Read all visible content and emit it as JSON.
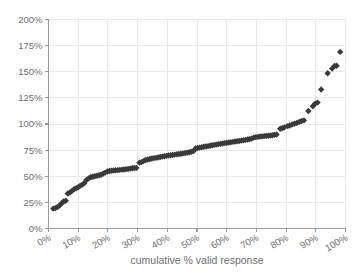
{
  "chart_data": {
    "type": "scatter",
    "title": "",
    "subtitle": "",
    "xlabel": "cumulative % valid response",
    "ylabel": "",
    "xlim": [
      0,
      100
    ],
    "ylim": [
      0,
      200
    ],
    "xticks": [
      "0%",
      "10%",
      "20%",
      "30%",
      "40%",
      "50%",
      "60%",
      "70%",
      "80%",
      "90%",
      "100%"
    ],
    "xtick_values": [
      0,
      10,
      20,
      30,
      40,
      50,
      60,
      70,
      80,
      90,
      100
    ],
    "yticks": [
      "0%",
      "25%",
      "50%",
      "75%",
      "100%",
      "125%",
      "150%",
      "175%",
      "200%"
    ],
    "ytick_values": [
      0,
      25,
      50,
      75,
      100,
      125,
      150,
      175,
      200
    ],
    "grid": true,
    "grid_color": "#e8e8e8",
    "axis_color": "#9a9a9a",
    "legend": false,
    "legend_position": "none",
    "marker": "diamond",
    "marker_color": "#3a3a3a",
    "marker_size": 3.2,
    "annotations": [],
    "series": [
      {
        "name": "cumulative valid response",
        "points": [
          [
            1.6,
            19.0
          ],
          [
            2.3,
            19.5
          ],
          [
            3.0,
            20.5
          ],
          [
            3.7,
            22.0
          ],
          [
            4.4,
            24.0
          ],
          [
            5.1,
            26.0
          ],
          [
            5.8,
            26.5
          ],
          [
            6.5,
            33.5
          ],
          [
            7.2,
            34.5
          ],
          [
            7.9,
            36.0
          ],
          [
            8.6,
            37.5
          ],
          [
            9.3,
            38.5
          ],
          [
            10.0,
            39.5
          ],
          [
            10.7,
            41.0
          ],
          [
            11.4,
            42.0
          ],
          [
            12.1,
            43.5
          ],
          [
            12.8,
            46.5
          ],
          [
            13.5,
            48.0
          ],
          [
            14.2,
            49.0
          ],
          [
            14.9,
            49.5
          ],
          [
            15.6,
            50.0
          ],
          [
            16.3,
            50.5
          ],
          [
            17.0,
            51.0
          ],
          [
            17.7,
            51.5
          ],
          [
            18.4,
            52.5
          ],
          [
            19.1,
            53.5
          ],
          [
            19.8,
            54.5
          ],
          [
            20.5,
            55.0
          ],
          [
            21.2,
            55.3
          ],
          [
            21.9,
            55.5
          ],
          [
            22.6,
            55.7
          ],
          [
            23.3,
            55.9
          ],
          [
            24.0,
            56.1
          ],
          [
            24.7,
            56.3
          ],
          [
            25.4,
            56.5
          ],
          [
            26.1,
            56.8
          ],
          [
            26.8,
            57.0
          ],
          [
            27.5,
            57.3
          ],
          [
            28.2,
            57.6
          ],
          [
            28.9,
            57.9
          ],
          [
            29.6,
            58.0
          ],
          [
            30.6,
            63.0
          ],
          [
            31.3,
            63.5
          ],
          [
            32.0,
            64.5
          ],
          [
            32.7,
            65.5
          ],
          [
            33.4,
            66.0
          ],
          [
            34.1,
            66.5
          ],
          [
            34.8,
            67.0
          ],
          [
            35.5,
            67.3
          ],
          [
            36.2,
            67.6
          ],
          [
            36.9,
            68.0
          ],
          [
            37.6,
            68.4
          ],
          [
            38.3,
            68.8
          ],
          [
            39.0,
            69.2
          ],
          [
            39.7,
            69.5
          ],
          [
            40.4,
            69.8
          ],
          [
            41.1,
            70.1
          ],
          [
            41.8,
            70.4
          ],
          [
            42.5,
            70.7
          ],
          [
            43.2,
            71.0
          ],
          [
            43.9,
            71.3
          ],
          [
            44.6,
            71.6
          ],
          [
            45.3,
            71.9
          ],
          [
            46.0,
            72.2
          ],
          [
            46.7,
            72.6
          ],
          [
            47.4,
            73.0
          ],
          [
            48.1,
            73.5
          ],
          [
            48.8,
            74.0
          ],
          [
            49.5,
            76.5
          ],
          [
            50.2,
            77.0
          ],
          [
            50.9,
            77.4
          ],
          [
            51.6,
            77.8
          ],
          [
            52.3,
            78.2
          ],
          [
            53.0,
            78.5
          ],
          [
            53.7,
            78.8
          ],
          [
            54.4,
            79.2
          ],
          [
            55.1,
            79.6
          ],
          [
            55.8,
            80.0
          ],
          [
            56.5,
            80.3
          ],
          [
            57.2,
            80.7
          ],
          [
            57.9,
            81.0
          ],
          [
            58.6,
            81.4
          ],
          [
            59.3,
            81.7
          ],
          [
            60.0,
            82.0
          ],
          [
            60.7,
            82.3
          ],
          [
            61.4,
            82.6
          ],
          [
            62.1,
            82.9
          ],
          [
            62.8,
            83.2
          ],
          [
            63.5,
            83.5
          ],
          [
            64.2,
            83.8
          ],
          [
            64.9,
            84.1
          ],
          [
            65.6,
            84.4
          ],
          [
            66.3,
            84.8
          ],
          [
            67.0,
            85.2
          ],
          [
            67.7,
            85.6
          ],
          [
            68.4,
            86.0
          ],
          [
            69.1,
            87.0
          ],
          [
            69.8,
            87.4
          ],
          [
            70.5,
            87.7
          ],
          [
            71.2,
            88.0
          ],
          [
            71.9,
            88.2
          ],
          [
            72.6,
            88.4
          ],
          [
            73.3,
            88.6
          ],
          [
            74.0,
            88.8
          ],
          [
            74.7,
            89.0
          ],
          [
            75.4,
            89.3
          ],
          [
            76.1,
            89.6
          ],
          [
            76.8,
            90.0
          ],
          [
            78.0,
            95.5
          ],
          [
            78.7,
            96.0
          ],
          [
            79.4,
            96.8
          ],
          [
            80.5,
            98.0
          ],
          [
            81.2,
            98.5
          ],
          [
            82.0,
            99.5
          ],
          [
            82.8,
            100.2
          ],
          [
            83.6,
            101.0
          ],
          [
            84.4,
            102.0
          ],
          [
            85.2,
            102.8
          ],
          [
            86.0,
            103.5
          ],
          [
            87.5,
            112.5
          ],
          [
            89.0,
            117.0
          ],
          [
            89.8,
            119.5
          ],
          [
            90.6,
            120.5
          ],
          [
            91.8,
            133.0
          ],
          [
            94.0,
            148.5
          ],
          [
            95.5,
            153.0
          ],
          [
            96.3,
            155.5
          ],
          [
            97.0,
            155.8
          ],
          [
            98.2,
            169.0
          ]
        ]
      }
    ]
  },
  "axis": {
    "x_title": "cumulative % valid response"
  }
}
